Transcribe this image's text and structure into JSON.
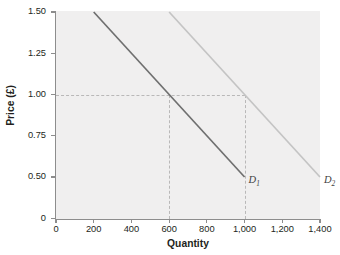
{
  "chart_data": {
    "type": "line",
    "title": "",
    "xlabel": "Quantity",
    "ylabel": "Price (£)",
    "xlim": [
      0,
      1400
    ],
    "ylim": [
      0,
      1.5
    ],
    "grid": false,
    "legend": "inline-end-of-line",
    "x_ticks": [
      {
        "value": 0,
        "label": "0"
      },
      {
        "value": 200,
        "label": "200"
      },
      {
        "value": 400,
        "label": "400"
      },
      {
        "value": 600,
        "label": "600"
      },
      {
        "value": 800,
        "label": "800"
      },
      {
        "value": 1000,
        "label": "1,000"
      },
      {
        "value": 1200,
        "label": "1,200"
      },
      {
        "value": 1400,
        "label": "1,400"
      }
    ],
    "y_ticks": [
      {
        "value": 0.0,
        "label": "0"
      },
      {
        "value": 0.5,
        "label": "0.50"
      },
      {
        "value": 0.75,
        "label": "0.75"
      },
      {
        "value": 1.0,
        "label": "1.00"
      },
      {
        "value": 1.25,
        "label": "1.25"
      },
      {
        "value": 1.5,
        "label": "1.50"
      }
    ],
    "series": [
      {
        "name": "D1",
        "label_text": "D",
        "label_sub": "1",
        "color": "#6f6f6f",
        "points": [
          {
            "x": 200,
            "y": 1.5
          },
          {
            "x": 1000,
            "y": 0.5
          }
        ]
      },
      {
        "name": "D2",
        "label_text": "D",
        "label_sub": "2",
        "color": "#c4c4c4",
        "points": [
          {
            "x": 600,
            "y": 1.5
          },
          {
            "x": 1400,
            "y": 0.5
          }
        ]
      }
    ],
    "annotations": [
      {
        "type": "guide-h",
        "value": 1.0,
        "from_x": 0,
        "to_x": 1000
      },
      {
        "type": "guide-v",
        "value": 600,
        "from_y": 0,
        "to_y": 1.0
      },
      {
        "type": "guide-v",
        "value": 1000,
        "from_y": 0,
        "to_y": 1.0
      }
    ],
    "colors": {
      "plot_background": "#f0efef",
      "axis": "#8d8d8d",
      "guide": "#b9b8b8",
      "text": "#231f20"
    }
  }
}
